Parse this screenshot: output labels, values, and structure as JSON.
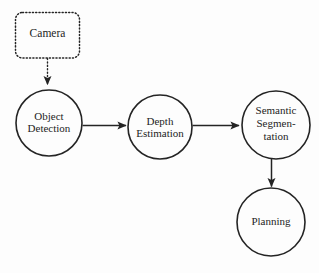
{
  "diagram": {
    "background_color": "#fdfdfd",
    "stroke_color": "#242424",
    "text_color": "#242424",
    "nodes": [
      {
        "id": "camera",
        "label": "Camera",
        "shape": "rounded-rectangle",
        "border_style": "dotted",
        "cx": 47.5,
        "cy": 35,
        "width": 65,
        "height": 46
      },
      {
        "id": "object-detection",
        "label_lines": [
          "Object",
          "Detection"
        ],
        "shape": "circle",
        "cx": 49,
        "cy": 123,
        "r": 33
      },
      {
        "id": "depth-estimation",
        "label_lines": [
          "Depth",
          "Estimation"
        ],
        "shape": "circle",
        "cx": 160,
        "cy": 127,
        "r": 32
      },
      {
        "id": "semantic-segmentation",
        "label_lines": [
          "Semantic",
          "Segmen-",
          "tation"
        ],
        "shape": "circle",
        "cx": 276,
        "cy": 125,
        "r": 34
      },
      {
        "id": "planning",
        "label_lines": [
          "Planning"
        ],
        "shape": "circle",
        "cx": 271,
        "cy": 222,
        "r": 34
      }
    ],
    "edges": [
      {
        "id": "camera-to-object-detection",
        "from": "camera",
        "to": "object-detection",
        "style": "dotted",
        "direction": "down"
      },
      {
        "id": "object-detection-to-depth-estimation",
        "from": "object-detection",
        "to": "depth-estimation",
        "style": "solid",
        "direction": "right"
      },
      {
        "id": "depth-estimation-to-semantic-segmentation",
        "from": "depth-estimation",
        "to": "semantic-segmentation",
        "style": "solid",
        "direction": "right"
      },
      {
        "id": "semantic-segmentation-to-planning",
        "from": "semantic-segmentation",
        "to": "planning",
        "style": "solid",
        "direction": "down"
      }
    ]
  },
  "labels": {
    "camera": "Camera",
    "object_detection_line1": "Object",
    "object_detection_line2": "Detection",
    "depth_estimation_line1": "Depth",
    "depth_estimation_line2": "Estimation",
    "semantic_segmentation_line1": "Semantic",
    "semantic_segmentation_line2": "Segmen-",
    "semantic_segmentation_line3": "tation",
    "planning_line1": "Planning"
  }
}
